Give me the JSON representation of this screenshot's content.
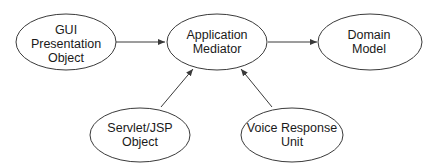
{
  "diagram": {
    "type": "flow",
    "colors": {
      "stroke": "#3a3a3a",
      "text": "#1a1a1a",
      "background": "#ffffff"
    },
    "nodes": [
      {
        "id": "gui",
        "shape": "ellipse",
        "lines": [
          "GUI",
          "Presentation",
          "Object"
        ]
      },
      {
        "id": "mediator",
        "shape": "ellipse",
        "lines": [
          "Application",
          "Mediator"
        ]
      },
      {
        "id": "domain",
        "shape": "ellipse",
        "lines": [
          "Domain",
          "Model"
        ]
      },
      {
        "id": "servlet",
        "shape": "ellipse",
        "lines": [
          "Servlet/JSP",
          "Object"
        ]
      },
      {
        "id": "voice",
        "shape": "ellipse",
        "lines": [
          "Voice Response",
          "Unit"
        ]
      }
    ],
    "edges": [
      {
        "from": "gui",
        "to": "mediator"
      },
      {
        "from": "mediator",
        "to": "domain"
      },
      {
        "from": "servlet",
        "to": "mediator"
      },
      {
        "from": "voice",
        "to": "mediator"
      }
    ]
  }
}
